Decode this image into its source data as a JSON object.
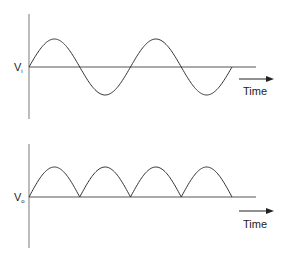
{
  "top_plot": {
    "ylabel": "V",
    "ylabel_sub": "i",
    "xlabel": "Time",
    "waveform": "sine",
    "description": "Input AC sine wave, two full cycles"
  },
  "bottom_plot": {
    "ylabel": "V",
    "ylabel_sub": "o",
    "xlabel": "Time",
    "waveform": "full-wave rectified sine",
    "description": "Output of full-wave rectifier, four positive half-cycles"
  },
  "colors": {
    "axis": "#999999",
    "curve": "#333333",
    "text": "#222222"
  }
}
